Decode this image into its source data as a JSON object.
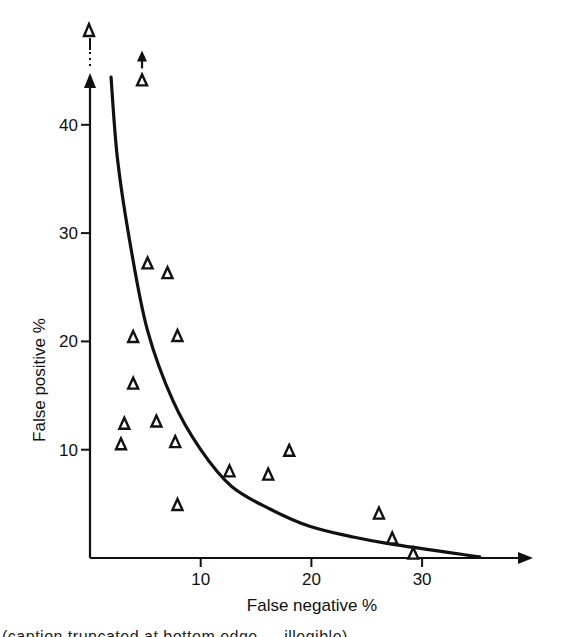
{
  "chart_data": {
    "type": "scatter",
    "title": "",
    "xlabel": "False negative %",
    "ylabel": "False positive %",
    "xlim": [
      0,
      40
    ],
    "ylim": [
      0,
      44
    ],
    "xticks": [
      10,
      20,
      30
    ],
    "yticks": [
      10,
      20,
      30,
      40
    ],
    "grid": false,
    "legend": null,
    "marker": "open-triangle",
    "series": [
      {
        "name": "observations",
        "points": [
          {
            "x": 4.7,
            "y": 44.1,
            "offscale_arrow": "up"
          },
          {
            "x": 5.2,
            "y": 27.2
          },
          {
            "x": 7.0,
            "y": 26.3
          },
          {
            "x": 3.9,
            "y": 20.4
          },
          {
            "x": 7.9,
            "y": 20.5
          },
          {
            "x": 3.9,
            "y": 16.1
          },
          {
            "x": 3.1,
            "y": 12.4
          },
          {
            "x": 6.0,
            "y": 12.6
          },
          {
            "x": 2.8,
            "y": 10.5
          },
          {
            "x": 7.7,
            "y": 10.7
          },
          {
            "x": 7.9,
            "y": 4.9
          },
          {
            "x": 12.6,
            "y": 8.0
          },
          {
            "x": 16.1,
            "y": 7.7
          },
          {
            "x": 18.0,
            "y": 9.9
          },
          {
            "x": 26.1,
            "y": 4.1
          },
          {
            "x": 27.3,
            "y": 1.8
          },
          {
            "x": 29.2,
            "y": 0.4
          }
        ],
        "offscale_points": [
          {
            "x": 0,
            "y": "above axis break",
            "note": "plotted beyond y-axis break"
          }
        ]
      },
      {
        "name": "fitted curve",
        "type": "line",
        "points": [
          {
            "x": 1.9,
            "y": 44.4
          },
          {
            "x": 2.5,
            "y": 36.7
          },
          {
            "x": 3.7,
            "y": 28.6
          },
          {
            "x": 5.2,
            "y": 21.0
          },
          {
            "x": 7.5,
            "y": 14.5
          },
          {
            "x": 10.0,
            "y": 10.0
          },
          {
            "x": 12.8,
            "y": 6.6
          },
          {
            "x": 16.3,
            "y": 4.5
          },
          {
            "x": 19.9,
            "y": 2.9
          },
          {
            "x": 23.5,
            "y": 2.0
          },
          {
            "x": 27.1,
            "y": 1.3
          },
          {
            "x": 35.2,
            "y": 0.1
          }
        ]
      }
    ],
    "annotations": [
      "y-axis break (dotted) with off-scale point at top",
      "upward arrow above point near x≈4.7 indicating value off scale"
    ]
  },
  "axes": {
    "x_title": "False negative %",
    "y_title": "False positive %",
    "x_ticks": [
      "10",
      "20",
      "30"
    ],
    "y_ticks": [
      "10",
      "20",
      "30",
      "40"
    ]
  },
  "caption": {
    "text": "(caption truncated at bottom edge — illegible)"
  }
}
